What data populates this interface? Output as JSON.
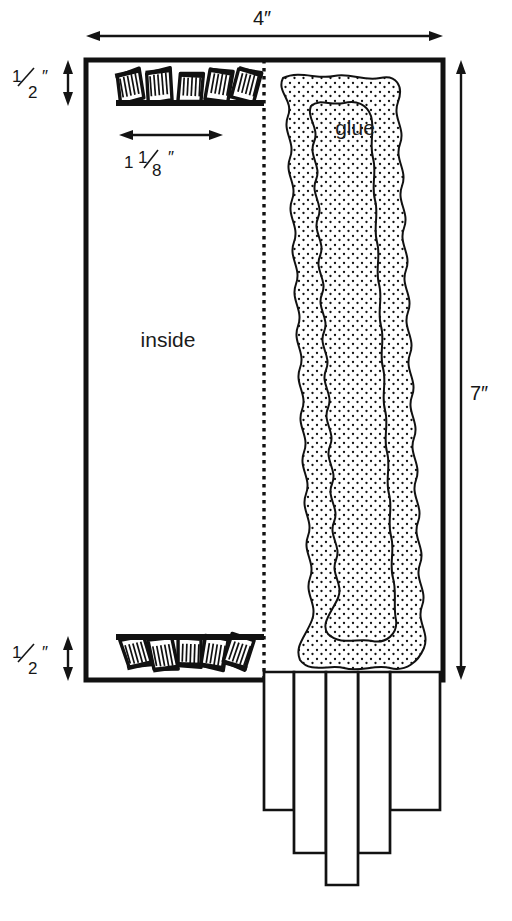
{
  "figure": {
    "background_color": "#ffffff",
    "ink_color": "#111111"
  },
  "dimensions": {
    "width_label": "4″",
    "height_label": "7″",
    "top_strip_label_whole": "",
    "top_strip_numerator": "1",
    "top_strip_denominator": "2",
    "top_strip_unit": "″",
    "bottom_strip_numerator": "1",
    "bottom_strip_denominator": "2",
    "bottom_strip_unit": "″",
    "comb_width_whole": "1",
    "comb_width_numerator": "1",
    "comb_width_denominator": "8",
    "comb_width_unit": "″"
  },
  "labels": {
    "inside": "inside",
    "glue": "glue"
  },
  "icons": {
    "width_arrow": "double-arrow-horizontal-icon",
    "height_arrow": "double-arrow-vertical-icon",
    "half_inch_arrow_top": "double-arrow-vertical-icon",
    "half_inch_arrow_bottom": "double-arrow-vertical-icon",
    "comb_width_arrow": "double-arrow-horizontal-icon",
    "fold_line": "dotted-fold-line-icon",
    "glue_band": "glue-bead-icon",
    "match_comb_top": "match-comb-icon",
    "match_comb_bottom": "match-comb-icon",
    "match_strips": "match-strip-icon"
  },
  "geometry": {
    "sheet": {
      "x": 86,
      "y": 60,
      "width": 357,
      "height": 620
    },
    "fold_x": 264,
    "top_band_y": 104,
    "bottom_band_y": 636,
    "strips": [
      {
        "x": 264,
        "width": 30,
        "bottom": 810
      },
      {
        "x": 294,
        "width": 32,
        "bottom": 853
      },
      {
        "x": 326,
        "width": 32,
        "bottom": 885
      },
      {
        "x": 358,
        "width": 32,
        "bottom": 853
      },
      {
        "x": 390,
        "width": 50,
        "bottom": 810
      }
    ]
  }
}
